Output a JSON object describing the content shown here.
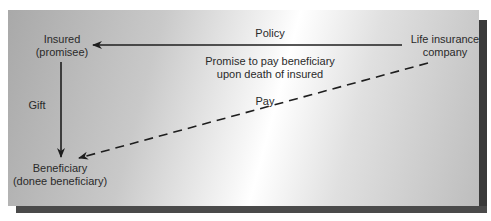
{
  "diagram": {
    "nodes": {
      "insured": {
        "line1": "Insured",
        "line2": "(promisee)"
      },
      "insurer": {
        "line1": "Life insurance",
        "line2": "company"
      },
      "beneficiary": {
        "line1": "Beneficiary",
        "line2": "(donee beneficiary)"
      }
    },
    "edges": {
      "policy": {
        "label": "Policy",
        "from": "insurer",
        "to": "insured",
        "style": "solid"
      },
      "promise": {
        "line1": "Promise to pay beneficiary",
        "line2": "upon death of insured"
      },
      "gift": {
        "label": "Gift",
        "from": "insured",
        "to": "beneficiary",
        "style": "solid"
      },
      "pay": {
        "label": "Pay",
        "from": "insurer",
        "to": "beneficiary",
        "style": "dashed"
      }
    }
  },
  "colors": {
    "line": "#1e1e1e",
    "text": "#2a2a2a",
    "shadow": "#3a3a3a"
  }
}
